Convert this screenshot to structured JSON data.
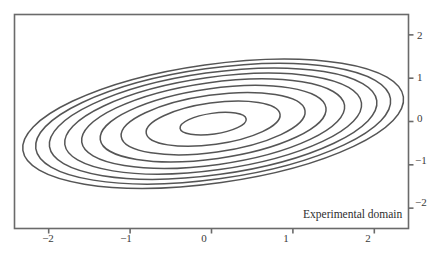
{
  "figure": {
    "background_color": "#ffffff",
    "frame_color": "#6a6a6a",
    "contour_color": "#555555",
    "text_color": "#2e2e2e",
    "annotation": "Experimental domain"
  },
  "chart_data": {
    "type": "line",
    "title": "",
    "xlabel": "",
    "ylabel": "",
    "xlim": [
      -2.42,
      2.42
    ],
    "ylim": [
      -2.47,
      2.47
    ],
    "grid": false,
    "legend": null,
    "xticks": [
      -2,
      -1,
      0,
      1,
      2
    ],
    "xticklabels": [
      "−2",
      "−1",
      "0",
      "1",
      "2"
    ],
    "yticks": [
      2,
      1,
      0,
      -1,
      -2
    ],
    "yticklabels": [
      "2",
      "1",
      "0",
      "−1",
      "−2"
    ],
    "annotations": [
      {
        "text": "Experimental domain",
        "x": 1.95,
        "y": -2.22
      }
    ],
    "contours": {
      "center_x": 0.02,
      "center_y": -0.05,
      "rotation_deg": -8,
      "aspect_ratio": 2.45,
      "count": 9,
      "levels": [
        1,
        2,
        3,
        4,
        5,
        6,
        7,
        8,
        9
      ],
      "semi_axis_x": [
        0.41,
        0.83,
        1.14,
        1.4,
        1.63,
        1.84,
        2.03,
        2.2,
        2.36
      ],
      "semi_axis_y": [
        0.24,
        0.48,
        0.66,
        0.81,
        0.95,
        1.07,
        1.18,
        1.28,
        1.37
      ]
    }
  }
}
